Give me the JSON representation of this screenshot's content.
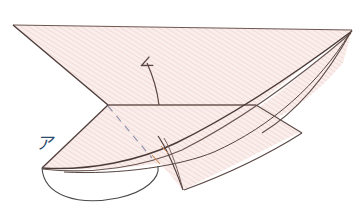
{
  "figure": {
    "background_color": "#ffffff",
    "paper_fill_color": "#f9ebe9",
    "hatch_line_color": "#efd2ce",
    "outline_color": "#5c4946",
    "crease_color": "#6b5550",
    "dashed_crease_color": "#8f8fa8",
    "arrow_color": "#5a4440",
    "arc_color": "#4a4a4a",
    "label_color": "#2d4a6b",
    "highlight_color": "#c98b5a"
  },
  "labels": [
    {
      "id": "label-a",
      "text": "ア",
      "meaning": "katakana-a",
      "x": 36,
      "y": 149,
      "color": "#2d4a6b"
    }
  ],
  "annotations": {
    "fold_arrow": {
      "name": "fold-direction-arrow",
      "style": "curved-open-arrowhead",
      "from_x": 159,
      "from_y": 105,
      "to_x": 146,
      "to_y": 60
    },
    "rotation_arc": {
      "name": "rotation-arc",
      "style": "elliptical-arc",
      "center_x": 100,
      "center_y": 168,
      "radius_x": 58,
      "radius_y": 27
    },
    "hidden_crease": {
      "name": "hidden-crease",
      "style": "dashed",
      "from_x": 108,
      "from_y": 106,
      "to_x": 152,
      "to_y": 158
    }
  },
  "geometry": {
    "upper_sheet_points": "13,25 352,30 256,105 108,105",
    "lower_flap_points": "108,105 256,105 183,190 42,168",
    "vertices": [
      {
        "name": "top-left",
        "x": 13,
        "y": 25
      },
      {
        "name": "top-right",
        "x": 352,
        "y": 30
      },
      {
        "name": "crease-left",
        "x": 108,
        "y": 105
      },
      {
        "name": "crease-right",
        "x": 256,
        "y": 105
      },
      {
        "name": "flap-left",
        "x": 42,
        "y": 168
      },
      {
        "name": "flap-bottom",
        "x": 183,
        "y": 190
      }
    ]
  }
}
